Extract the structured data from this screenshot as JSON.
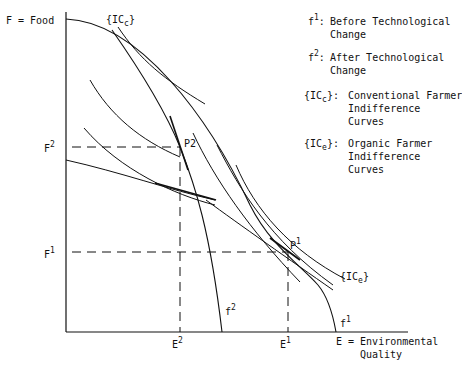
{
  "axes": {
    "y_label": "F = Food",
    "x_label_line1": "E = Environmental",
    "x_label_line2": "Quality"
  },
  "ticks": {
    "F2": {
      "base": "F",
      "sup": "2"
    },
    "F1": {
      "base": "F",
      "sup": "1"
    },
    "E2": {
      "base": "E",
      "sup": "2"
    },
    "E1": {
      "base": "E",
      "sup": "1"
    }
  },
  "points": {
    "P2": {
      "base": "P",
      "sup": "2"
    },
    "P1": {
      "base": "P",
      "sup": "1"
    }
  },
  "curve_labels": {
    "f2": {
      "base": "f",
      "sup": "2"
    },
    "f1": {
      "base": "f",
      "sup": "1"
    },
    "ICc": "{IC",
    "ICc_sub": "c",
    "ICc_close": "}",
    "ICe": "{IC",
    "ICe_sub": "e",
    "ICe_close": "}"
  },
  "legend": [
    {
      "key_base": "f",
      "key_sup": "1",
      "key_suffix": ":",
      "lines": [
        "Before Technological",
        "Change"
      ]
    },
    {
      "key_base": "f",
      "key_sup": "2",
      "key_suffix": ":",
      "lines": [
        "After Technological",
        "Change"
      ]
    },
    {
      "key_base": "{IC",
      "key_sub": "c",
      "key_suffix": "}:",
      "lines": [
        "Conventional Farmer",
        "Indifference",
        "Curves"
      ]
    },
    {
      "key_base": "{IC",
      "key_sub": "e",
      "key_suffix": "}:",
      "lines": [
        "Organic Farmer",
        "Indifference",
        "Curves"
      ]
    }
  ]
}
